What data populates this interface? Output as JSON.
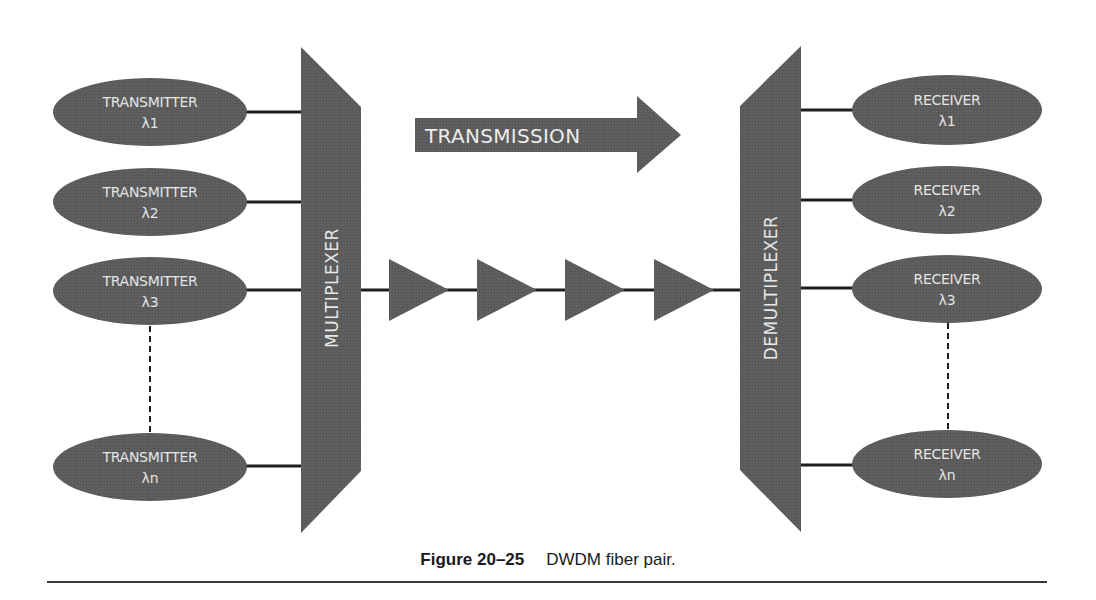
{
  "colors": {
    "shape_fill": "#5b5b5b",
    "connector": "#1e1e1e",
    "text_on_shape": "#e4e4e4",
    "background": "#ffffff"
  },
  "transmission_arrow": {
    "label": "TRANSMISSION",
    "direction": "right"
  },
  "multiplexer": {
    "label": "MULTIPLEXER"
  },
  "demultiplexer": {
    "label": "DEMULTIPLEXER"
  },
  "transmitters": [
    {
      "title": "TRANSMITTER",
      "wavelength": "λ1"
    },
    {
      "title": "TRANSMITTER",
      "wavelength": "λ2"
    },
    {
      "title": "TRANSMITTER",
      "wavelength": "λ3"
    },
    {
      "title": "TRANSMITTER",
      "wavelength": "λn"
    }
  ],
  "receivers": [
    {
      "title": "RECEIVER",
      "wavelength": "λ1"
    },
    {
      "title": "RECEIVER",
      "wavelength": "λ2"
    },
    {
      "title": "RECEIVER",
      "wavelength": "λ3"
    },
    {
      "title": "RECEIVER",
      "wavelength": "λn"
    }
  ],
  "amplifiers": {
    "count": 4,
    "icon": "amplifier-triangle-icon"
  },
  "caption": {
    "figure_number": "Figure 20–25",
    "text": "DWDM fiber pair."
  }
}
